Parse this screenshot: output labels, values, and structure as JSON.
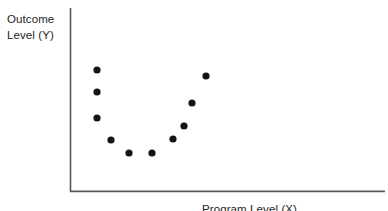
{
  "figure": {
    "y_axis_label": "Outcome\nLevel (Y)",
    "x_axis_label": "Program Level (X)",
    "axis_color": "#58585a",
    "point_color": "#141414"
  },
  "chart_data": {
    "type": "scatter",
    "title": "",
    "xlabel": "Program Level (X)",
    "ylabel": "Outcome Level (Y)",
    "grid": false,
    "legend": null,
    "xlim": [
      0,
      100
    ],
    "ylim": [
      0,
      100
    ],
    "x": [
      8,
      8,
      8,
      13,
      19,
      26,
      33,
      36,
      39,
      42,
      43
    ],
    "y": [
      66,
      54,
      40,
      28,
      21,
      21,
      28,
      34,
      42,
      54,
      66
    ],
    "points_px": [
      {
        "cx": 97,
        "cy": 70
      },
      {
        "cx": 97,
        "cy": 92
      },
      {
        "cx": 97,
        "cy": 118
      },
      {
        "cx": 111,
        "cy": 140
      },
      {
        "cx": 129,
        "cy": 153
      },
      {
        "cx": 152,
        "cy": 153
      },
      {
        "cx": 173,
        "cy": 139
      },
      {
        "cx": 184,
        "cy": 126
      },
      {
        "cx": 192,
        "cy": 103
      },
      {
        "cx": 206,
        "cy": 76
      }
    ],
    "point_count": 10
  }
}
